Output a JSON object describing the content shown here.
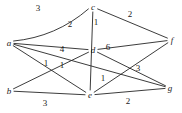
{
  "figure": {
    "background_color": "#ffffff",
    "stroke_color": "#262626",
    "text_color": "#1a1a1a",
    "width": 182,
    "height": 113
  },
  "nodes": [
    {
      "id": "a",
      "label": "a",
      "x": 9,
      "y": 43
    },
    {
      "id": "b",
      "label": "b",
      "x": 9,
      "y": 91
    },
    {
      "id": "c",
      "label": "c",
      "x": 93,
      "y": 7
    },
    {
      "id": "d",
      "label": "d",
      "x": 93,
      "y": 50
    },
    {
      "id": "e",
      "label": "e",
      "x": 90,
      "y": 95
    },
    {
      "id": "f",
      "label": "f",
      "x": 172,
      "y": 40
    },
    {
      "id": "g",
      "label": "g",
      "x": 170,
      "y": 88
    }
  ],
  "edges": [
    {
      "id": "a-c",
      "from": "a",
      "to": "c",
      "weight": "3",
      "curved": true,
      "label_x": 38,
      "label_y": 8
    },
    {
      "id": "a-d",
      "from": "a",
      "to": "d",
      "weight": "2",
      "curved": false,
      "label_x": 70,
      "label_y": 24
    },
    {
      "id": "a-e",
      "from": "a",
      "to": "e",
      "weight": "4",
      "curved": false,
      "label_x": 62,
      "label_y": 49
    },
    {
      "id": "a-g",
      "from": "a",
      "to": "g",
      "weight": "1",
      "curved": false,
      "label_x": 62,
      "label_y": 65
    },
    {
      "id": "b-d",
      "from": "b",
      "to": "d",
      "weight": "1",
      "curved": false,
      "label_x": 46,
      "label_y": 63
    },
    {
      "id": "b-e",
      "from": "b",
      "to": "e",
      "weight": "3",
      "curved": false,
      "label_x": 45,
      "label_y": 103
    },
    {
      "id": "c-e",
      "from": "c",
      "to": "e",
      "weight": "1",
      "curved": false,
      "label_x": 96,
      "label_y": 22
    },
    {
      "id": "c-f",
      "from": "c",
      "to": "f",
      "weight": "2",
      "curved": false,
      "label_x": 130,
      "label_y": 14
    },
    {
      "id": "d-f",
      "from": "d",
      "to": "f",
      "weight": "6",
      "curved": false,
      "label_x": 108,
      "label_y": 47
    },
    {
      "id": "d-g",
      "from": "d",
      "to": "g",
      "weight": "3",
      "curved": false,
      "label_x": 138,
      "label_y": 68
    },
    {
      "id": "e-f",
      "from": "e",
      "to": "f",
      "weight": "1",
      "curved": false,
      "label_x": 103,
      "label_y": 78
    },
    {
      "id": "e-g",
      "from": "e",
      "to": "g",
      "weight": "2",
      "curved": false,
      "label_x": 128,
      "label_y": 101
    }
  ]
}
